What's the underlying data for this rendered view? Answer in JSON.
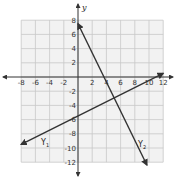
{
  "chart_data": {
    "type": "line",
    "title": "",
    "xlabel": "",
    "ylabel": "y",
    "xlim": [
      -8,
      12
    ],
    "ylim": [
      -12,
      8
    ],
    "grid": true,
    "x_ticks": [
      -8,
      -6,
      -4,
      -2,
      2,
      4,
      6,
      8,
      10,
      12
    ],
    "y_ticks": [
      8,
      6,
      4,
      2,
      -2,
      -4,
      -6,
      -8,
      -10,
      -12
    ],
    "series": [
      {
        "name": "Y1",
        "label_main": "Y",
        "label_sub": "1",
        "equation": "y = 0.5x - 5.5",
        "slope": 0.5,
        "intercept": -5.5,
        "points": [
          [
            -8,
            -9.5
          ],
          [
            12,
            0.5
          ]
        ],
        "color": "#333333"
      },
      {
        "name": "Y2",
        "label_main": "Y",
        "label_sub": "2",
        "equation": "y = -2x + 7",
        "slope": -2,
        "intercept": 7,
        "points": [
          [
            0,
            7.5
          ],
          [
            9.7,
            -12.4
          ]
        ],
        "color": "#333333"
      }
    ],
    "intersection": [
      5,
      -3
    ]
  },
  "colors": {
    "grid_bg": "#f2f2f2",
    "grid_line": "#c8c8c8",
    "axis": "#333333",
    "line": "#333333"
  }
}
